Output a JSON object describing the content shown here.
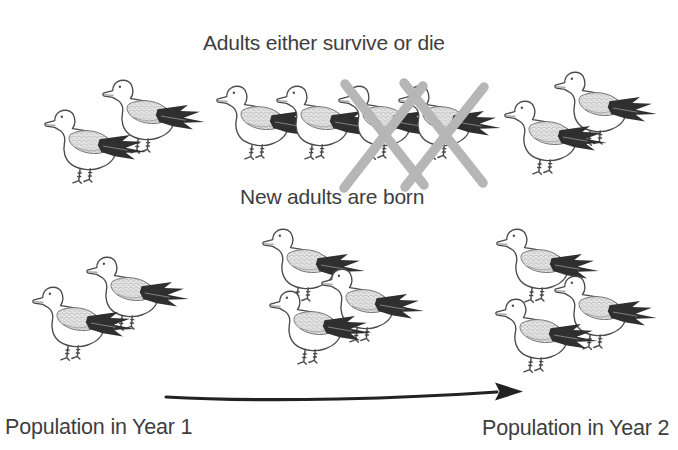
{
  "captions": {
    "survive_or_die": "Adults either survive or die",
    "new_adults": "New adults are born",
    "year1": "Population in Year 1",
    "year2": "Population in Year 2"
  },
  "colors": {
    "background": "#ffffff",
    "text": "#3e3e3e",
    "bird_outline": "#4a4a4a",
    "wing_fill": "#ececec",
    "wing_hatch": "#9b9b9b",
    "tail_dark": "#2f2f2f",
    "cross_gray": "#b6b6b6",
    "arrow_dark": "#222222"
  },
  "bird": {
    "species": "seagull",
    "width": 110,
    "height": 88
  },
  "groups": [
    {
      "id": "year1-adults-top",
      "count": 2,
      "crossed_count": 0,
      "birds": [
        {
          "x": 100,
          "y": 72
        },
        {
          "x": 42,
          "y": 102
        }
      ]
    },
    {
      "id": "survive-or-die-row",
      "count": 4,
      "crossed_count": 2,
      "birds": [
        {
          "x": 214,
          "y": 78
        },
        {
          "x": 274,
          "y": 78
        },
        {
          "x": 336,
          "y": 78
        },
        {
          "x": 396,
          "y": 78
        }
      ]
    },
    {
      "id": "survivors-top-right",
      "count": 2,
      "crossed_count": 0,
      "birds": [
        {
          "x": 552,
          "y": 64
        },
        {
          "x": 502,
          "y": 93
        }
      ]
    },
    {
      "id": "year1-population-bottom",
      "count": 2,
      "crossed_count": 0,
      "birds": [
        {
          "x": 84,
          "y": 249
        },
        {
          "x": 30,
          "y": 279
        }
      ]
    },
    {
      "id": "new-adults-born",
      "count": 3,
      "crossed_count": 0,
      "birds": [
        {
          "x": 260,
          "y": 221
        },
        {
          "x": 319,
          "y": 261
        },
        {
          "x": 267,
          "y": 283
        }
      ]
    },
    {
      "id": "year2-population",
      "count": 3,
      "crossed_count": 0,
      "birds": [
        {
          "x": 494,
          "y": 221
        },
        {
          "x": 552,
          "y": 268
        },
        {
          "x": 493,
          "y": 291
        }
      ]
    }
  ],
  "crosses": [
    {
      "x1": 345,
      "y1": 84,
      "x2": 424,
      "y2": 185
    },
    {
      "x1": 423,
      "y1": 86,
      "x2": 344,
      "y2": 188
    },
    {
      "x1": 404,
      "y1": 83,
      "x2": 483,
      "y2": 183
    },
    {
      "x1": 484,
      "y1": 87,
      "x2": 405,
      "y2": 187
    }
  ],
  "arrow": {
    "path": "M 166 397 C 270 403 410 398 497 392",
    "head_points": "495,382.5 523,391.5 495,400.5 499.5,391.5"
  }
}
